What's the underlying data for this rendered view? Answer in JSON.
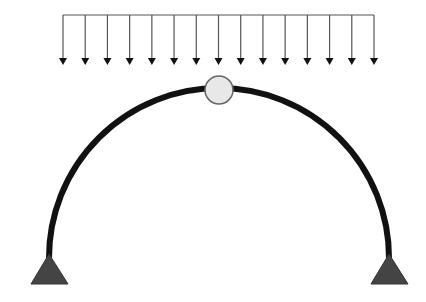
{
  "diagram": {
    "colors": {
      "background": "#ffffff",
      "arch": "#111111",
      "load": "#555555",
      "arrowhead": "#111111",
      "hinge_fill": "#e8e8e8",
      "hinge_stroke": "#666666",
      "support_fill": "#444444"
    },
    "load": {
      "type": "uniformly-distributed-load",
      "bar_y": 15,
      "x_start": 63,
      "x_end": 374,
      "arrow_count": 15,
      "arrow_tip_y": 65
    },
    "arch": {
      "shape": "semicircular",
      "left_base": [
        49,
        258
      ],
      "right_base": [
        389,
        258
      ],
      "apex_y": 88,
      "stroke_width": 6
    },
    "crown_hinge": {
      "cx": 219,
      "cy": 90,
      "r": 14
    },
    "supports": [
      {
        "name": "left-pin-support",
        "apex": [
          49,
          254
        ],
        "base_left": [
          31,
          284
        ],
        "base_right": [
          68,
          284
        ]
      },
      {
        "name": "right-pin-support",
        "apex": [
          389,
          254
        ],
        "base_left": [
          371,
          284
        ],
        "base_right": [
          408,
          284
        ]
      }
    ]
  }
}
